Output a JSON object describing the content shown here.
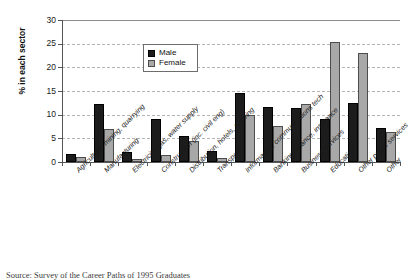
{
  "chart_data": {
    "type": "bar",
    "title": "",
    "xlabel": "",
    "ylabel": "% in each sector",
    "ylim": [
      0,
      30
    ],
    "yticks": [
      0,
      5,
      10,
      15,
      20,
      25,
      30
    ],
    "grid": true,
    "legend_position": "upper-left-inside",
    "categories": [
      "Agriculture, mining, quarrying",
      "Manufacturing",
      "Electricity, gas, water supply",
      "Construction (inc. civil eng)",
      "Distribution, hotels, catering",
      "Transport",
      "Information, communications tech",
      "Banking, finance, insurance",
      "Business services",
      "Education",
      "Other public services",
      "Other"
    ],
    "series": [
      {
        "name": "Male",
        "color": "#1c1c1c",
        "values": [
          1.6,
          12.3,
          2.2,
          9.1,
          5.5,
          2.4,
          14.6,
          11.7,
          11.5,
          9.1,
          12.5,
          7.2
        ]
      },
      {
        "name": "Female",
        "color": "#a8a8a8",
        "values": [
          1.0,
          7.0,
          0.7,
          1.5,
          4.4,
          0.9,
          9.9,
          7.7,
          12.3,
          25.3,
          23.0,
          6.4
        ]
      }
    ]
  },
  "legend": {
    "items": [
      {
        "label": "Male"
      },
      {
        "label": "Female"
      }
    ]
  },
  "caption": {
    "text": "Source: Survey of the Career Paths of 1995 Graduates"
  }
}
